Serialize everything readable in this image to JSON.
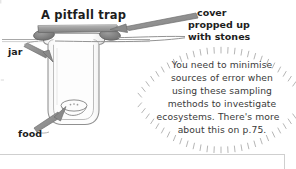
{
  "figure": {
    "title": "A pitfall trap",
    "labels": {
      "cover": "cover",
      "propped_up": "propped up",
      "with_stones": "with stones",
      "jar": "jar",
      "food": "food"
    }
  },
  "speech_bubble": {
    "lines": [
      "You need to minimise",
      "sources of error when",
      "using these sampling",
      "methods to investigate",
      "ecosystems.  There's more",
      "about this on p.75."
    ],
    "full_text": "You need to minimise sources of error when using these sampling methods to investigate ecosystems. There's more about this on p.75."
  },
  "colors": {
    "ink": "#2b2b2b",
    "cover_bar": "#9a9a9a",
    "cover_bar_edge": "#6d6d6d",
    "stone": "#777777",
    "jar_outline": "#8c8c8c",
    "jar_fill": "#fbfbfb",
    "arrow": "#8d8d8d",
    "bubble_ticks": "#a6a6a6",
    "page_rule": "#c9c9c9",
    "background": "#ffffff"
  }
}
